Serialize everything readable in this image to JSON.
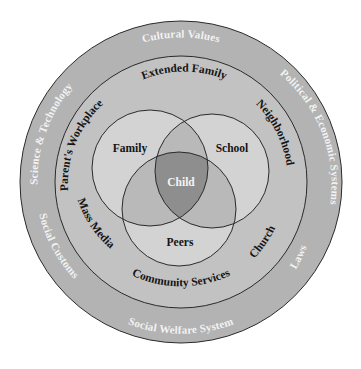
{
  "diagram": {
    "type": "concentric-venn",
    "colors": {
      "background": "#ffffff",
      "outer_ring": "#b3b3b3",
      "middle_ring": "#c2c2c2",
      "venn_single": "#d3d3d3",
      "venn_pair": "#b9b9b9",
      "venn_center": "#8e8e8e",
      "line": "#2a2a2a",
      "outer_text": "#f2f2f2",
      "inner_text": "#141414"
    },
    "outer_ring": {
      "labels": {
        "top": "Cultural Values",
        "upper_left": "Science & Technology",
        "upper_right": "Political & Economic Systems",
        "lower_left": "Social Customs",
        "lower_right": "Laws",
        "bottom": "Social Welfare System"
      }
    },
    "middle_ring": {
      "labels": {
        "top": "Extended Family",
        "upper_left": "Parent's Workplace",
        "upper_right": "Neighborhood",
        "lower_left": "Mass Media",
        "lower_right": "Church",
        "bottom": "Community Services"
      }
    },
    "venn": {
      "circles": [
        {
          "label": "Family"
        },
        {
          "label": "School"
        },
        {
          "label": "Peers"
        }
      ],
      "center_label": "Child"
    }
  }
}
